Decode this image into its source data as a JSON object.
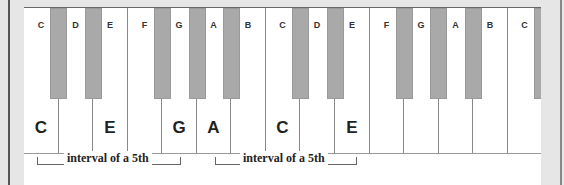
{
  "diagram": {
    "white_keys": [
      {
        "top_label": "C",
        "big_label": "C"
      },
      {
        "top_label": "D",
        "big_label": ""
      },
      {
        "top_label": "E",
        "big_label": "E"
      },
      {
        "top_label": "F",
        "big_label": ""
      },
      {
        "top_label": "G",
        "big_label": "G"
      },
      {
        "top_label": "A",
        "big_label": "A"
      },
      {
        "top_label": "B",
        "big_label": ""
      },
      {
        "top_label": "C",
        "big_label": "C"
      },
      {
        "top_label": "D",
        "big_label": ""
      },
      {
        "top_label": "E",
        "big_label": "E"
      },
      {
        "top_label": "F",
        "big_label": ""
      },
      {
        "top_label": "G",
        "big_label": ""
      },
      {
        "top_label": "A",
        "big_label": ""
      },
      {
        "top_label": "B",
        "big_label": ""
      },
      {
        "top_label": "C",
        "big_label": ""
      }
    ],
    "intervals": [
      {
        "label": "interval of a 5th",
        "from_key": "C",
        "to_key": "G"
      },
      {
        "label": "interval of a 5th",
        "from_key": "A",
        "to_key": "E"
      }
    ],
    "colors": {
      "black_key": "#a9a9a9",
      "white_key": "#ffffff",
      "frame": "#e6e6e6"
    }
  }
}
